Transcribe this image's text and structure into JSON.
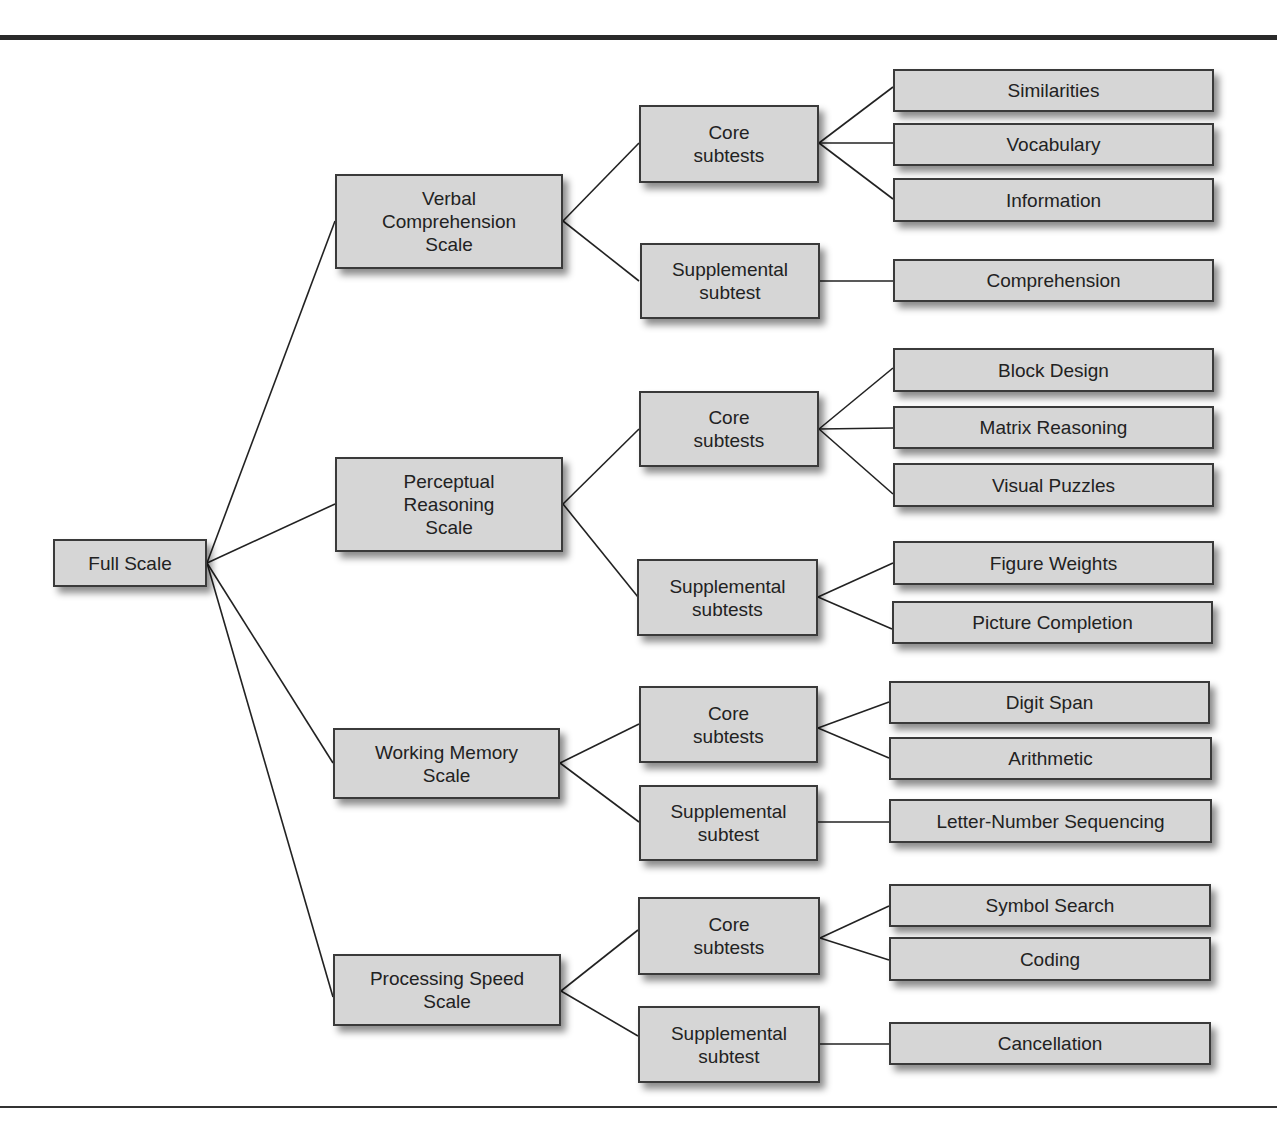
{
  "diagram": {
    "root": {
      "label": "Full Scale"
    },
    "scales": [
      {
        "label": "Verbal\nComprehension\nScale"
      },
      {
        "label": "Perceptual\nReasoning\nScale"
      },
      {
        "label": "Working Memory\nScale"
      },
      {
        "label": "Processing Speed\nScale"
      }
    ],
    "groups": [
      {
        "label": "Core\nsubtests"
      },
      {
        "label": "Supplemental\nsubtest"
      },
      {
        "label": "Core\nsubtests"
      },
      {
        "label": "Supplemental\nsubtests"
      },
      {
        "label": "Core\nsubtests"
      },
      {
        "label": "Supplemental\nsubtest"
      },
      {
        "label": "Core\nsubtests"
      },
      {
        "label": "Supplemental\nsubtest"
      }
    ],
    "subtests": [
      {
        "label": "Similarities"
      },
      {
        "label": "Vocabulary"
      },
      {
        "label": "Information"
      },
      {
        "label": "Comprehension"
      },
      {
        "label": "Block Design"
      },
      {
        "label": "Matrix Reasoning"
      },
      {
        "label": "Visual Puzzles"
      },
      {
        "label": "Figure Weights"
      },
      {
        "label": "Picture Completion"
      },
      {
        "label": "Digit Span"
      },
      {
        "label": "Arithmetic"
      },
      {
        "label": "Letter-Number Sequencing"
      },
      {
        "label": "Symbol Search"
      },
      {
        "label": "Coding"
      },
      {
        "label": "Cancellation"
      }
    ]
  }
}
